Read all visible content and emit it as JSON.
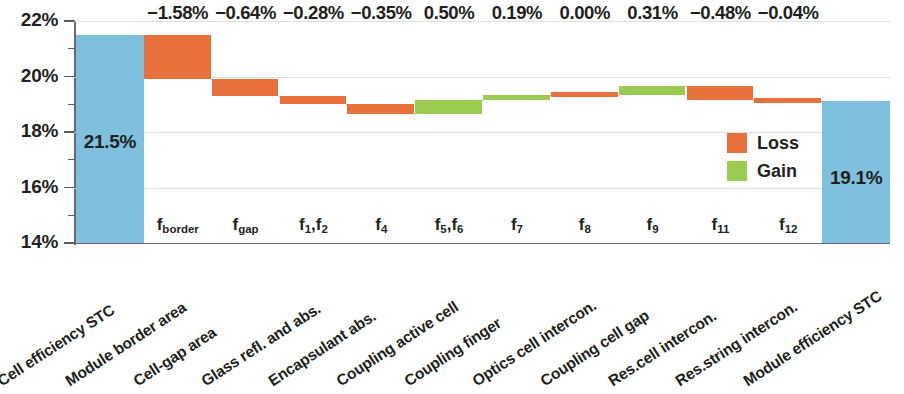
{
  "chart_data": {
    "type": "bar",
    "chart_style": "waterfall",
    "title": "",
    "xlabel": "",
    "ylabel": "",
    "ylim": [
      14,
      22
    ],
    "yticks": [
      "14%",
      "16%",
      "18%",
      "20%",
      "22%"
    ],
    "ytick_values": [
      14,
      16,
      18,
      20,
      22
    ],
    "yminor_values": [
      15,
      17,
      19,
      21
    ],
    "grid": true,
    "legend_position": "inside-right",
    "categories": [
      "Cell efficiency STC",
      "Module border area",
      "Cell-gap area",
      "Glass refl. and abs.",
      "Encapsulant abs.",
      "Coupling active cell",
      "Coupling finger",
      "Optics cell intercon.",
      "Coupling cell gap",
      "Res.cell intercon.",
      "Res.string intercon.",
      "Module efficiency STC"
    ],
    "factor_labels": [
      "",
      "f_border",
      "f_gap",
      "f_1,f_2",
      "f_4",
      "f_5,f_6",
      "f_7",
      "f_8",
      "f_9",
      "f_11",
      "f_12",
      ""
    ],
    "factor_labels_html": [
      "",
      "f<sub>border</sub>",
      "f<sub>gap</sub>",
      "f<sub>1</sub>,f<sub>2</sub>",
      "f<sub>4</sub>",
      "f<sub>5</sub>,f<sub>6</sub>",
      "f<sub>7</sub>",
      "f<sub>8</sub>",
      "f<sub>9</sub>",
      "f<sub>11</sub>",
      "f<sub>12</sub>",
      ""
    ],
    "delta_labels": [
      "",
      "−1.58%",
      "−0.64%",
      "−0.28%",
      "−0.35%",
      "0.50%",
      "0.19%",
      "0.00%",
      "0.31%",
      "−0.48%",
      "−0.04%",
      ""
    ],
    "deltas": [
      null,
      -1.58,
      -0.64,
      -0.28,
      -0.35,
      0.5,
      0.19,
      0.0,
      0.31,
      -0.48,
      -0.04,
      null
    ],
    "bar_types": [
      "total",
      "loss",
      "loss",
      "loss",
      "loss",
      "gain",
      "gain",
      "zero",
      "gain",
      "loss",
      "loss",
      "total"
    ],
    "bar_start": [
      14.0,
      19.92,
      19.28,
      19.0,
      18.65,
      18.65,
      19.15,
      19.34,
      19.34,
      19.17,
      19.13,
      14.0
    ],
    "bar_end": [
      21.5,
      21.5,
      19.92,
      19.28,
      19.0,
      19.15,
      19.34,
      19.34,
      19.65,
      19.65,
      19.17,
      19.13
    ],
    "cumulative": [
      21.5,
      19.92,
      19.28,
      19.0,
      18.65,
      19.15,
      19.34,
      19.34,
      19.65,
      19.17,
      19.13,
      19.13
    ],
    "value_labels": [
      {
        "index": 0,
        "text": "21.5%",
        "value": 21.5
      },
      {
        "index": 11,
        "text": "19.1%",
        "value": 19.1
      }
    ],
    "legend": [
      {
        "label": "Loss",
        "color": "#E8703A"
      },
      {
        "label": "Gain",
        "color": "#9CCB52"
      }
    ],
    "colors": {
      "total": "#7EC0DE",
      "loss": "#E8703A",
      "gain": "#9CCB52",
      "axis": "#6a6a6a",
      "grid": "#d9d9d9",
      "text": "#231f20",
      "connector": "#caa089"
    }
  }
}
